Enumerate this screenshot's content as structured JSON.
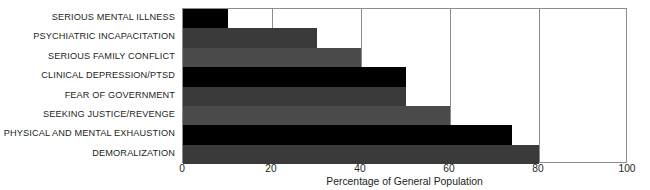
{
  "chart_data": {
    "type": "bar",
    "orientation": "horizontal",
    "title": "",
    "subtitle": "",
    "xlabel": "Percentage of General Population",
    "ylabel": "",
    "xlim": [
      0,
      100
    ],
    "xticks": [
      0,
      20,
      40,
      60,
      80,
      100
    ],
    "xtick_labels": [
      "0",
      "20",
      "40",
      "60",
      "80",
      "100"
    ],
    "grid": "vertical",
    "legend": null,
    "categories": [
      "SERIOUS MENTAL ILLNESS",
      "PSYCHIATRIC INCAPACITATION",
      "SERIOUS FAMILY CONFLICT",
      "CLINICAL DEPRESSION/PTSD",
      "FEAR OF GOVERNMENT",
      "SEEKING JUSTICE/REVENGE",
      "PHYSICAL AND MENTAL EXHAUSTION",
      "DEMORALIZATION"
    ],
    "values": [
      10,
      30,
      40,
      50,
      50,
      60,
      74,
      80
    ],
    "bar_colors": [
      "#000000",
      "#3a3a3a",
      "#4a4a4a",
      "#000000",
      "#3a3a3a",
      "#4a4a4a",
      "#000000",
      "#3a3a3a"
    ],
    "axis_color": "#8d8d8d",
    "text_color": "#231f20",
    "background": "#ffffff"
  }
}
